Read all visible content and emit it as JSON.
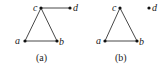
{
  "figure": {
    "panels": [
      {
        "caption": "(a)",
        "nodes": [
          {
            "id": "a",
            "label": "a",
            "x": 25,
            "y": 41
          },
          {
            "id": "b",
            "label": "b",
            "x": 57,
            "y": 41
          },
          {
            "id": "c",
            "label": "c",
            "x": 41,
            "y": 8
          },
          {
            "id": "d",
            "label": "d",
            "x": 70,
            "y": 8
          }
        ],
        "edges": [
          [
            "a",
            "b"
          ],
          [
            "a",
            "c"
          ],
          [
            "b",
            "c"
          ],
          [
            "c",
            "d"
          ]
        ]
      },
      {
        "caption": "(b)",
        "nodes": [
          {
            "id": "a",
            "label": "a",
            "x": 105,
            "y": 41
          },
          {
            "id": "b",
            "label": "b",
            "x": 137,
            "y": 41
          },
          {
            "id": "c",
            "label": "c",
            "x": 120,
            "y": 8
          },
          {
            "id": "d",
            "label": "d",
            "x": 149,
            "y": 8
          }
        ],
        "edges": [
          [
            "a",
            "b"
          ],
          [
            "a",
            "c"
          ],
          [
            "b",
            "c"
          ]
        ]
      }
    ],
    "colors": {
      "edge": "#333333",
      "node": "#111111",
      "text": "#222222"
    }
  }
}
